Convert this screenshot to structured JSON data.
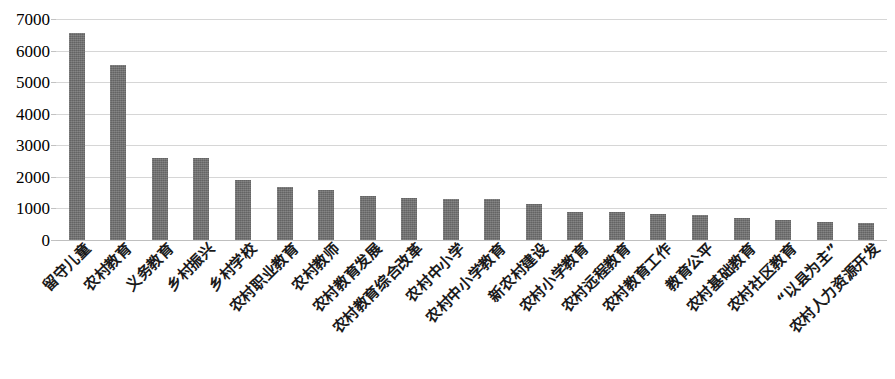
{
  "chart_data": {
    "type": "bar",
    "title": "",
    "subtitle": "",
    "xlabel": "",
    "ylabel": "",
    "ylim": [
      0,
      7000
    ],
    "ytick_step": 1000,
    "ytick_labels": [
      "7000",
      "6000",
      "5000",
      "4000",
      "3000",
      "2000",
      "1000",
      "0"
    ],
    "ytick_values": [
      7000,
      6000,
      5000,
      4000,
      3000,
      2000,
      1000,
      0
    ],
    "grid": true,
    "grid_axis": "y",
    "legend": false,
    "legend_position": "none",
    "bar_color": "#6d6d6d",
    "gridline_color": "#d6d6d6",
    "background_color": "#ffffff",
    "categories": [
      "留守儿童",
      "农村教育",
      "义务教育",
      "乡村振兴",
      "乡村学校",
      "农村职业教育",
      "农村教师",
      "农村教育发展",
      "农村教育综合改革",
      "农村中小学",
      "农村中小学教育",
      "新农村建设",
      "农村小学教育",
      "农村远程教育",
      "农村教育工作",
      "教育公平",
      "农村基础教育",
      "农村社区教育",
      "“以县为主”",
      "农村人力资源开发"
    ],
    "values": [
      6550,
      5550,
      2600,
      2600,
      1900,
      1680,
      1580,
      1380,
      1320,
      1300,
      1300,
      1150,
      900,
      880,
      820,
      790,
      700,
      620,
      560,
      530
    ]
  }
}
